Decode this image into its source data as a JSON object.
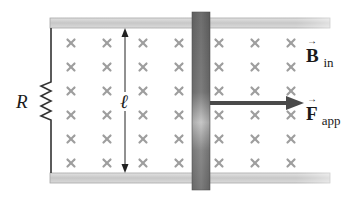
{
  "figure": {
    "type": "physics-diagram",
    "description_visible": "Sliding conducting bar on rails in magnetic field",
    "labels": {
      "resistor": "R",
      "length": "ℓ",
      "field_symbol": "B",
      "field_subscript": "in",
      "force_symbol": "F",
      "force_subscript": "app",
      "vector_arrow": "→"
    },
    "field_marker_glyph": "×",
    "field_grid": {
      "columns_x": [
        71,
        107,
        143,
        179,
        219,
        255,
        291
      ],
      "rows_y": [
        43,
        67,
        91,
        115,
        139,
        163
      ]
    },
    "colors": {
      "rail": "#b8b8b8",
      "rail_edge": "#8a8a8a",
      "bar": "#7a7a7a",
      "bar_highlight": "#bdbdbd",
      "wire": "#333333",
      "field_marker": "#9a9a9a",
      "force_arrow": "#4a4a4a",
      "text": "#1a1a1a"
    }
  }
}
